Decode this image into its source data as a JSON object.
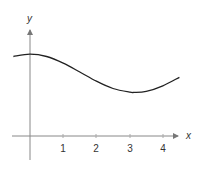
{
  "chart_data": {
    "type": "line",
    "title": "",
    "xlabel": "x",
    "ylabel": "y",
    "x_ticks": [
      "1",
      "2",
      "3",
      "4"
    ],
    "xlim": [
      -0.5,
      4.5
    ],
    "grid": false,
    "legend": null,
    "series": [
      {
        "name": "f(x)",
        "description": "cosine-shaped curve: maximum near x=0, minimum near x=3.1",
        "x": [
          -0.5,
          0,
          0.5,
          1,
          1.5,
          2,
          2.5,
          3,
          3.14,
          3.5,
          4,
          4.5
        ],
        "y": [
          2.41,
          2.48,
          2.41,
          2.21,
          1.94,
          1.66,
          1.44,
          1.33,
          1.32,
          1.35,
          1.52,
          1.78
        ]
      }
    ],
    "colors": {
      "axis": "#888888",
      "curve": "#222222",
      "text": "#333333"
    }
  }
}
